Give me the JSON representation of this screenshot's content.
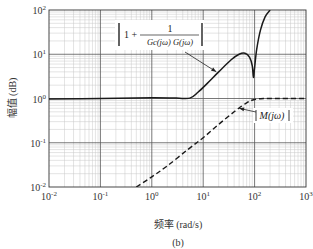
{
  "chart_data": {
    "type": "line",
    "title": "",
    "caption": "(b)",
    "xlabel": "频率 (rad/s)",
    "ylabel": "幅值 (dB)",
    "xscale": "log",
    "yscale": "log",
    "xlim": [
      0.01,
      1000
    ],
    "ylim": [
      0.01,
      100
    ],
    "grid": true,
    "x_ticks": [
      {
        "value": 0.01,
        "base": "10",
        "exp": "-2"
      },
      {
        "value": 0.1,
        "base": "10",
        "exp": "-1"
      },
      {
        "value": 1,
        "base": "10",
        "exp": "0"
      },
      {
        "value": 10,
        "base": "10",
        "exp": "1"
      },
      {
        "value": 100,
        "base": "10",
        "exp": "2"
      },
      {
        "value": 1000,
        "base": "10",
        "exp": "3"
      }
    ],
    "y_ticks": [
      {
        "value": 0.01,
        "base": "10",
        "exp": "-2"
      },
      {
        "value": 0.1,
        "base": "10",
        "exp": "-1"
      },
      {
        "value": 1,
        "base": "10",
        "exp": "0"
      },
      {
        "value": 10,
        "base": "10",
        "exp": "1"
      },
      {
        "value": 100,
        "base": "10",
        "exp": "2"
      }
    ],
    "series": [
      {
        "name": "|1 + 1/(Gc(jω)G(jω))|",
        "style": "solid",
        "color": "#1a1a1a",
        "x": [
          0.01,
          0.1,
          1,
          3,
          5.5,
          8,
          12,
          20,
          35,
          50,
          65,
          80,
          90,
          95,
          100,
          110,
          130,
          160,
          200
        ],
        "y": [
          0.98,
          1.0,
          1.04,
          1.02,
          1.02,
          1.4,
          2.2,
          4.0,
          7.5,
          10.0,
          10.5,
          8.5,
          5.5,
          3.0,
          5.0,
          13.0,
          35.0,
          70.0,
          100.0
        ]
      },
      {
        "name": "|M(jω)|",
        "style": "dashed",
        "color": "#1a1a1a",
        "x": [
          0.5,
          1,
          2,
          5,
          10,
          20,
          40,
          70,
          100,
          150,
          300,
          1000
        ],
        "y": [
          0.01,
          0.017,
          0.03,
          0.07,
          0.13,
          0.26,
          0.5,
          0.8,
          0.95,
          1.0,
          1.0,
          1.0
        ]
      }
    ],
    "annotations": [
      {
        "target": "|1 + 1/(Gc(jω)G(jω))|",
        "lead": "1 +",
        "numerator": "1",
        "denominator": "Gc(jω) G(jω)",
        "box": true,
        "arrow_at": {
          "x": 18,
          "y": 4
        }
      },
      {
        "target": "|M(jω)|",
        "text": "M(jω)",
        "arrow_at": {
          "x": 50,
          "y": 0.6
        }
      }
    ]
  }
}
